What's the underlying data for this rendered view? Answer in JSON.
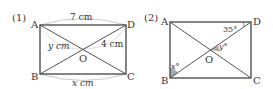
{
  "figures": [
    {
      "number": "(1)",
      "vertices": {
        "A": "A",
        "B": "B",
        "C": "C",
        "D": "D",
        "O": "O"
      },
      "top_length": "7 cm",
      "diagonal_left": "y cm",
      "diagonal_right": "4 cm",
      "bottom_length": "x cm"
    },
    {
      "number": "(2)",
      "vertices": {
        "A": "A",
        "B": "B",
        "C": "C",
        "D": "D",
        "O": "O"
      },
      "angle_D": "35°",
      "angle_O": "y°",
      "angle_B": "x°"
    }
  ],
  "colors": {
    "line": "#444444",
    "arc": "#cccccc",
    "shade": "#aaaaaa"
  }
}
